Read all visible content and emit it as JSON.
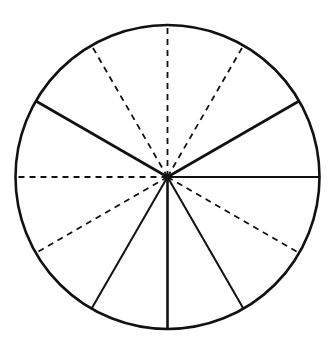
{
  "diagram": {
    "type": "circle-divided-into-sectors",
    "width": 336,
    "height": 358,
    "background": "#ffffff",
    "stroke_color": "#111111",
    "circle": {
      "cx": 167.5,
      "cy": 177,
      "r": 152,
      "stroke_width": 2.6
    },
    "divisions": 12,
    "angle_step_deg": 30,
    "angle_reference": "degrees clockwise from top (12 o'clock)",
    "radii": [
      {
        "angle": 0,
        "style": "dashed",
        "width": 1.8
      },
      {
        "angle": 30,
        "style": "dashed",
        "width": 1.8
      },
      {
        "angle": 60,
        "style": "solid",
        "width": 2.6
      },
      {
        "angle": 90,
        "style": "solid",
        "width": 2.0
      },
      {
        "angle": 120,
        "style": "dashed",
        "width": 1.8
      },
      {
        "angle": 150,
        "style": "solid",
        "width": 2.0
      },
      {
        "angle": 180,
        "style": "solid",
        "width": 2.6
      },
      {
        "angle": 210,
        "style": "solid",
        "width": 2.0
      },
      {
        "angle": 240,
        "style": "dashed",
        "width": 1.8
      },
      {
        "angle": 270,
        "style": "dashed",
        "width": 1.8
      },
      {
        "angle": 300,
        "style": "solid",
        "width": 2.6
      },
      {
        "angle": 330,
        "style": "dashed",
        "width": 1.8
      }
    ],
    "dash_pattern": "6 5",
    "solid_count": 6,
    "dashed_count": 6
  }
}
